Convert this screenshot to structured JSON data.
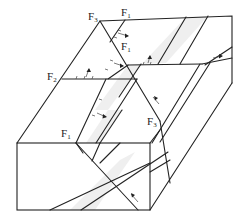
{
  "diagram": {
    "type": "block-diagram",
    "colors": {
      "line": "#222222",
      "band_fill": "#efefef",
      "background": "#ffffff"
    },
    "labels": [
      {
        "id": "f3-top",
        "main": "F",
        "sub": "3",
        "x": 88,
        "y": 20
      },
      {
        "id": "f1-top",
        "main": "F",
        "sub": "1",
        "x": 121,
        "y": 16
      },
      {
        "id": "f1-mid",
        "main": "F",
        "sub": "1",
        "x": 121,
        "y": 50
      },
      {
        "id": "f2-left",
        "main": "F",
        "sub": "2",
        "x": 47,
        "y": 80
      },
      {
        "id": "f1-front",
        "main": "F",
        "sub": "1",
        "x": 61,
        "y": 137
      },
      {
        "id": "f3-right",
        "main": "F",
        "sub": "3",
        "x": 147,
        "y": 125
      }
    ]
  }
}
